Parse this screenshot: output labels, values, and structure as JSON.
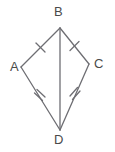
{
  "figure": {
    "name": "kite-abcd",
    "shape_type": "kite",
    "background_color": "#ffffff",
    "stroke_color": "#6e6e73",
    "label_color": "#4a4a4a",
    "stroke_width": 1.3,
    "canvas": {
      "width": 115,
      "height": 152
    },
    "vertices": [
      {
        "id": "B",
        "label": "B",
        "x": 60,
        "y": 28,
        "label_x": 54,
        "label_y": 5
      },
      {
        "id": "A",
        "label": "A",
        "x": 21,
        "y": 67,
        "label_x": 10,
        "label_y": 60
      },
      {
        "id": "C",
        "label": "C",
        "x": 89,
        "y": 64,
        "label_x": 94,
        "label_y": 57
      },
      {
        "id": "D",
        "label": "D",
        "x": 60,
        "y": 130,
        "label_x": 54,
        "label_y": 133
      }
    ],
    "edges": [
      {
        "id": "AB",
        "from": "A",
        "to": "B",
        "tick_marks": 1
      },
      {
        "id": "BC",
        "from": "B",
        "to": "C",
        "tick_marks": 1
      },
      {
        "id": "AD",
        "from": "A",
        "to": "D",
        "tick_marks": 2
      },
      {
        "id": "CD",
        "from": "C",
        "to": "D",
        "tick_marks": 2
      }
    ],
    "diagonals": [
      {
        "id": "BD",
        "from": "B",
        "to": "D",
        "tick_marks": 0
      }
    ],
    "labels": {
      "B": "B",
      "A": "A",
      "C": "C",
      "D": "D"
    }
  }
}
